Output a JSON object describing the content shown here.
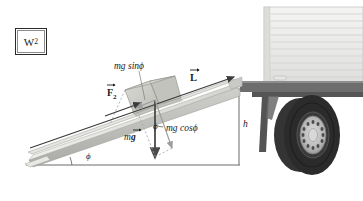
{
  "figure": {
    "title_tag": "W2",
    "background": "#ffffff",
    "ink_color": "#1b1b1b"
  },
  "panel_label": {
    "name": "W",
    "subscript": "2",
    "border_color": "#2a2a2a"
  },
  "labels": {
    "mg_sin_phi": "mg sinϕ",
    "force_F": "F",
    "force_F_sub": "2",
    "length_L": "L",
    "mg_cos_phi": "mg cosϕ",
    "weight_mg": "mg",
    "weight_m": "m",
    "weight_g": "g",
    "angle_phi_mid": "ϕ",
    "angle_phi_base": "ϕ",
    "height_h": "h"
  },
  "vectors": [
    {
      "id": "applied-force",
      "label": "F2",
      "direction": "up the incline",
      "color": "#3c3c3c"
    },
    {
      "id": "ramp-length",
      "label": "L",
      "direction": "up the incline along ramp surface",
      "color": "#3c3c3c"
    },
    {
      "id": "weight",
      "label": "mg",
      "direction": "vertically downward",
      "color": "#4a4a4a"
    },
    {
      "id": "weight-normal-component",
      "label": "mg cosϕ",
      "direction": "perpendicular into incline",
      "color": "#9a9a9a"
    },
    {
      "id": "weight-parallel-component",
      "label": "mg sinϕ",
      "direction": "down the incline",
      "color": "#9a9a9a"
    }
  ],
  "geometry": {
    "incline_angle_symbol": "ϕ",
    "bed_height_symbol": "h"
  },
  "palette": {
    "ramp_light": "#f2f2f0",
    "ramp_mid": "#d8d8d6",
    "ramp_dark": "#b9b9b6",
    "crate_light": "#dcdcd8",
    "crate_mid": "#c9c9c4",
    "crate_dark": "#b2b2ad",
    "truck_body": "#ececeb",
    "truck_rib": "#d5d5d3",
    "truck_bed": "#6f6f6f",
    "tire_black": "#2e2e2e",
    "hub_gray": "#bdbdbd",
    "ground_line": "#6b6b6b"
  }
}
